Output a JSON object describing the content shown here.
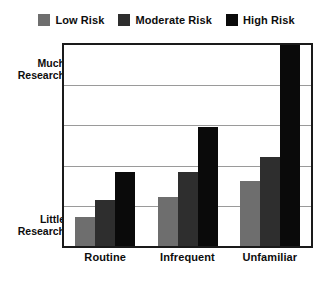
{
  "chart_data": {
    "type": "bar",
    "title": "",
    "subtitle": "",
    "xlabel": "",
    "ylabel": "",
    "categories": [
      "Routine",
      "Infrequent",
      "Unfamiliar"
    ],
    "series": [
      {
        "name": "Low Risk",
        "color": "#6e6e6e",
        "values": [
          0.73,
          1.22,
          1.61
        ]
      },
      {
        "name": "Moderate Risk",
        "color": "#2e2e2e",
        "values": [
          1.15,
          1.85,
          2.22
        ]
      },
      {
        "name": "High Risk",
        "color": "#0a0a0a",
        "values": [
          1.83,
          2.95,
          5.0
        ]
      }
    ],
    "ylim": [
      0,
      5
    ],
    "y_tick_labels": [
      "Little Research",
      "Much Research"
    ],
    "y_tick_values": [
      0,
      4
    ],
    "gridlines": [
      1,
      2,
      3,
      4
    ],
    "grid": true,
    "legend_position": "top-center",
    "axis_color": "#1a1a1a",
    "grid_color": "#9a9a9a",
    "background": "#ffffff"
  },
  "legend": {
    "items": [
      {
        "label": "Low Risk",
        "color": "#6e6e6e"
      },
      {
        "label": "Moderate Risk",
        "color": "#2e2e2e"
      },
      {
        "label": "High Risk",
        "color": "#0a0a0a"
      }
    ]
  },
  "yaxis": {
    "top_label_line1": "Much",
    "top_label_line2": "Research",
    "bottom_label_line1": "Little",
    "bottom_label_line2": "Research"
  },
  "xaxis": {
    "labels": [
      "Routine",
      "Infrequent",
      "Unfamiliar"
    ]
  }
}
